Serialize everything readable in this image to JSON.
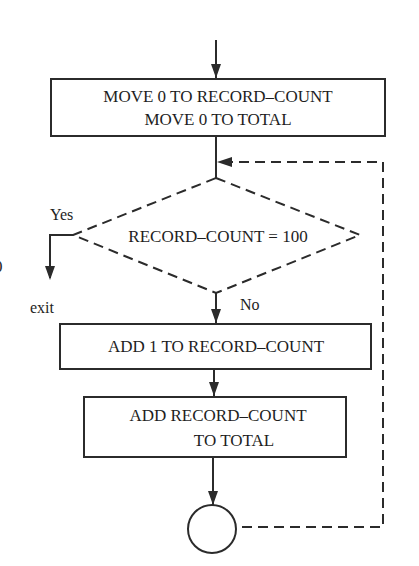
{
  "diagram": {
    "type": "flowchart",
    "colors": {
      "stroke": "#2b2b2b",
      "text": "#1e1e1e",
      "background": "#ffffff"
    },
    "nodes": {
      "init": {
        "line1": "MOVE 0 TO RECORD–COUNT",
        "line2": "MOVE 0 TO TOTAL"
      },
      "decision": {
        "label": "RECORD–COUNT = 100"
      },
      "increment": {
        "label": "ADD 1 TO RECORD–COUNT"
      },
      "accumulate": {
        "line1": "ADD RECORD–COUNT",
        "line2": "TO TOTAL"
      },
      "connector": {
        "label": ""
      }
    },
    "edges": {
      "yes_label": "Yes",
      "no_label": "No",
      "exit_label": "exit"
    },
    "margin_fragment": "0"
  }
}
